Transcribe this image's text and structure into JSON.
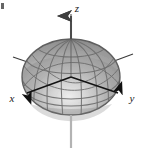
{
  "figure": {
    "title": "",
    "kind": "3d-ellipsoid-surface-plot",
    "background_color": "#ffffff",
    "surface": {
      "name": "ellipsoid",
      "fill_light": "#e6e6e6",
      "fill_mid": "#a8a8a8",
      "fill_dark": "#8a8a8a",
      "outline_color": "#6b6b6b",
      "mesh_color": "#6e6e6e",
      "highlight_color": "#ededed",
      "center_x": 71,
      "center_y": 77,
      "radius_x": 49,
      "radius_y": 38
    },
    "axes": [
      {
        "id": "z",
        "label": "z",
        "label_x": 76,
        "label_y": 10,
        "color": "#9a9a9a",
        "arrow": "up",
        "orientation": "vertical",
        "from_x": 71,
        "from_y": 148,
        "to_x": 71,
        "to_y": 14
      },
      {
        "id": "x",
        "label": "x",
        "label_x": 12,
        "label_y": 100,
        "color": "#1f1f1f",
        "arrow": "down-left",
        "orientation": "front-left",
        "from_x": 71,
        "from_y": 77,
        "to_x": 25,
        "to_y": 95
      },
      {
        "id": "y",
        "label": "y",
        "label_x": 131,
        "label_y": 100,
        "color": "#1f1f1f",
        "arrow": "down-right",
        "orientation": "front-right",
        "from_x": 71,
        "from_y": 77,
        "to_x": 120,
        "to_y": 95
      },
      {
        "id": "x-back",
        "label": "",
        "color": "#3a3a3a",
        "arrow": "none",
        "orientation": "back-right",
        "from_x": 71,
        "from_y": 77,
        "to_x": 132,
        "to_y": 55
      },
      {
        "id": "y-back",
        "label": "",
        "color": "#3a3a3a",
        "arrow": "none",
        "orientation": "back-left",
        "from_x": 71,
        "from_y": 77,
        "to_x": 14,
        "to_y": 57
      }
    ],
    "corner_mark": {
      "name": "crop-mark",
      "x": 1,
      "y": 3,
      "width": 3,
      "height": 6,
      "color": "#4a4a4a"
    }
  }
}
